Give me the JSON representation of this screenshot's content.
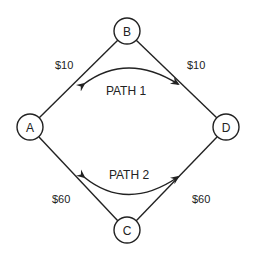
{
  "nodes": [
    {
      "id": "A",
      "label": "A"
    },
    {
      "id": "B",
      "label": "B"
    },
    {
      "id": "C",
      "label": "C"
    },
    {
      "id": "D",
      "label": "D"
    }
  ],
  "edges": [
    {
      "from": "A",
      "to": "B",
      "cost": "$10"
    },
    {
      "from": "B",
      "to": "D",
      "cost": "$10"
    },
    {
      "from": "A",
      "to": "C",
      "cost": "$60"
    },
    {
      "from": "C",
      "to": "D",
      "cost": "$60"
    }
  ],
  "paths": [
    {
      "label": "PATH 1"
    },
    {
      "label": "PATH 2"
    }
  ]
}
